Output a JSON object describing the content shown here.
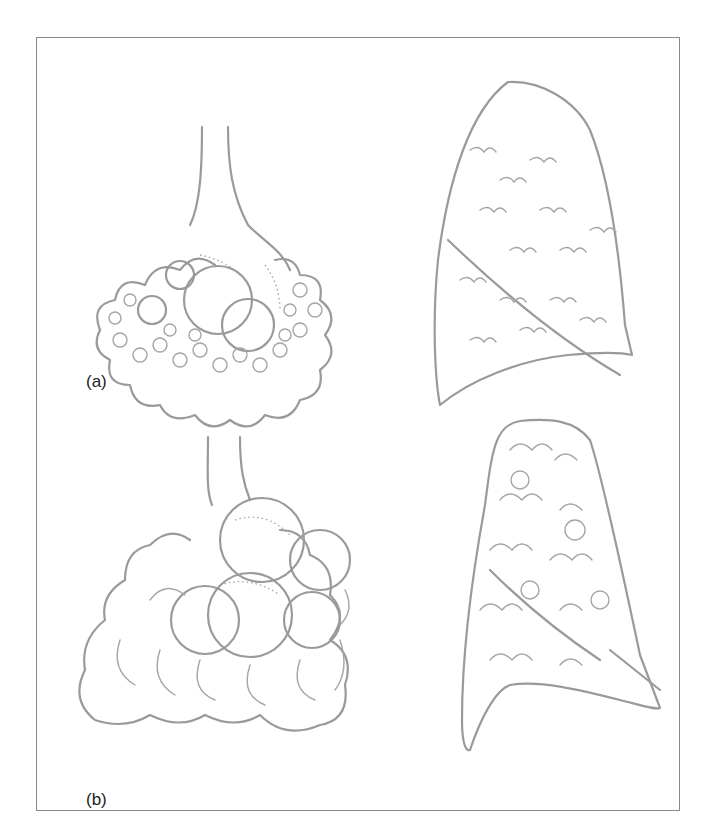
{
  "figure": {
    "panels": [
      {
        "label": "(a)",
        "left": "acinus-clustered-small-alveoli",
        "right": "lung-fine-pattern"
      },
      {
        "label": "(b)",
        "left": "acinus-enlarged-alveoli",
        "right": "lung-coarse-pattern"
      }
    ]
  },
  "colors": {
    "line": "#9a9a9a",
    "frame": "#8a8a8a",
    "text": "#222222"
  }
}
